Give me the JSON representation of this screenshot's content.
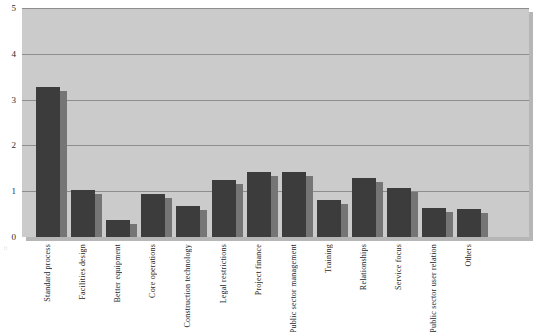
{
  "chart_data": {
    "type": "bar",
    "title": "",
    "subtitle": "",
    "xlabel": "",
    "ylabel": "",
    "ylim": [
      0,
      5
    ],
    "yticks": [
      0,
      1,
      2,
      3,
      4,
      5
    ],
    "ytick_labels": [
      "0",
      "1",
      "2",
      "3",
      "4",
      "5"
    ],
    "grid": true,
    "legend": "none",
    "categories": [
      "Standard process",
      "Facilities design",
      "Better equipment",
      "Core operations",
      "Construction technology",
      "Legal restrictions",
      "Project finance",
      "Public sector management",
      "Training",
      "Relationships",
      "Service focus",
      "Public sector user relation",
      "Others"
    ],
    "values": [
      3.28,
      1.02,
      0.38,
      0.95,
      0.68,
      1.24,
      1.41,
      1.43,
      0.81,
      1.28,
      1.08,
      0.64,
      0.62
    ],
    "series": [
      {
        "name": "Value",
        "values": [
          3.28,
          1.02,
          0.38,
          0.95,
          0.68,
          1.24,
          1.41,
          1.43,
          0.81,
          1.28,
          1.08,
          0.64,
          0.62
        ]
      }
    ]
  },
  "style": {
    "plot_background": "#cbcbcb",
    "bar_front_color": "#3c3c3c",
    "bar_side_color": "#757575",
    "gridline_color": "#8d8d8d",
    "page_background": "#ffffff"
  },
  "edge_artifact": "::"
}
